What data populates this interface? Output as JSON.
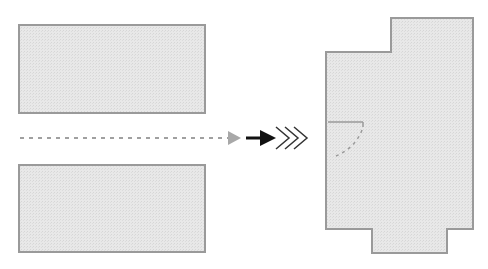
{
  "diagram": {
    "colors": {
      "background": "#ffffff",
      "shape_fill": "#e6e6e6",
      "shape_stroke": "#9a9a9a",
      "dashed_line": "#a0a0a0",
      "gray_arrowhead": "#a8a8a8",
      "black_arrow": "#111111",
      "chevron_stroke": "#333333",
      "inner_mark": "#9a9a9a"
    },
    "shapes": {
      "top_left_rect": {
        "x": 19,
        "y": 25,
        "width": 186,
        "height": 88
      },
      "bottom_left_rect": {
        "x": 19,
        "y": 165,
        "width": 186,
        "height": 87
      },
      "merged_polygon_points": "391,18 473,18 473,229 447,229 447,253 372,253 372,229 326,229 326,52 391,52"
    },
    "connectors": {
      "dashed_line": {
        "x1": 20,
        "y1": 138,
        "x2": 229,
        "y2": 138
      },
      "gray_arrowhead_points": "228,131 241,138 228,145",
      "black_arrow_shaft": {
        "x1": 246,
        "y1": 138,
        "x2": 262,
        "y2": 138
      },
      "black_arrowhead_points": "260,130 276,138 260,146",
      "chevrons": [
        "276,127 289,138 276,149",
        "285,127 298,138 285,149",
        "294,127 307,138 294,149"
      ]
    },
    "inner_mark": {
      "line": {
        "x1": 328,
        "y1": 122,
        "x2": 363,
        "y2": 122
      },
      "tick": {
        "x1": 363,
        "y1": 122,
        "x2": 363,
        "y2": 127
      },
      "dashed_curve": "M 362 130 Q 355 148 336 156"
    }
  }
}
